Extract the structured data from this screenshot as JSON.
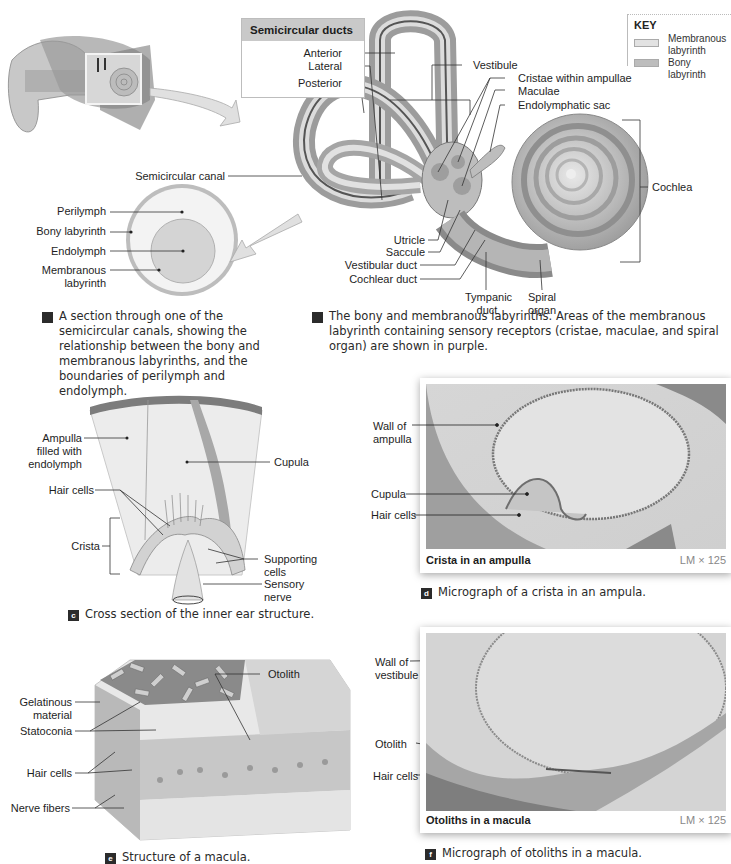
{
  "key": {
    "title": "KEY",
    "items": [
      {
        "label": "Membranous labyrinth",
        "line1": "Membranous",
        "line2": "labyrinth",
        "color": "#e2e2e2"
      },
      {
        "label": "Bony labyrinth",
        "color": "#bdbdbd"
      }
    ]
  },
  "panel_b": {
    "duct_box": {
      "title": "Semicircular ducts",
      "items": [
        "Anterior",
        "Lateral",
        "Posterior"
      ]
    },
    "labels": {
      "vestibule": "Vestibule",
      "cristae": "Cristae within ampullae",
      "maculae": "Maculae",
      "endolymphatic_sac": "Endolymphatic sac",
      "semicircular_canal": "Semicircular canal",
      "cochlea": "Cochlea",
      "utricle": "Utricle",
      "saccule": "Saccule",
      "vestibular_duct": "Vestibular duct",
      "cochlear_duct": "Cochlear duct",
      "tympanic_duct_1": "Tympanic",
      "tympanic_duct_2": "duct",
      "spiral_organ_1": "Spiral",
      "spiral_organ_2": "organ"
    },
    "caption_letter": "b",
    "caption": "The bony and membranous labyrinths. Areas of the membranous labyrinth containing sensory receptors (cristae, maculae, and spiral organ) are shown in purple."
  },
  "panel_a": {
    "labels": {
      "perilymph": "Perilymph",
      "bony_labyrinth": "Bony labyrinth",
      "endolymph": "Endolymph",
      "membranous_1": "Membranous",
      "membranous_2": "labyrinth"
    },
    "caption_letter": "a",
    "caption": "A section through one of the semicircular canals, showing the relationship between the bony and membranous labyrinths, and the boundaries of perilymph and endolymph."
  },
  "panel_c": {
    "labels": {
      "ampulla_1": "Ampulla",
      "ampulla_2": "filled with",
      "ampulla_3": "endolymph",
      "cupula": "Cupula",
      "hair_cells": "Hair cells",
      "crista": "Crista",
      "supporting_1": "Supporting",
      "supporting_2": "cells",
      "sensory_1": "Sensory",
      "sensory_2": "nerve"
    },
    "caption_letter": "c",
    "caption": "Cross section of the inner ear structure."
  },
  "panel_d": {
    "labels": {
      "wall_1": "Wall of",
      "wall_2": "ampulla",
      "cupula": "Cupula",
      "hair_cells": "Hair cells"
    },
    "title": "Crista in an ampulla",
    "magnification": "LM × 125",
    "caption_letter": "d",
    "caption": "Micrograph of a crista in an ampula."
  },
  "panel_e": {
    "labels": {
      "otolith": "Otolith",
      "gelatinous_1": "Gelatinous",
      "gelatinous_2": "material",
      "statoconia": "Statoconia",
      "hair_cells": "Hair cells",
      "nerve_fibers": "Nerve fibers"
    },
    "caption_letter": "e",
    "caption": "Structure of a macula."
  },
  "panel_f": {
    "labels": {
      "wall_1": "Wall of",
      "wall_2": "vestibule",
      "otolith": "Otolith",
      "hair_cells": "Hair cells"
    },
    "title": "Otoliths in a macula",
    "magnification": "LM × 125",
    "caption_letter": "f",
    "caption": "Micrograph of otoliths in a macula."
  }
}
